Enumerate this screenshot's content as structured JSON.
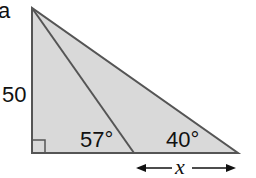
{
  "figure": {
    "corner_label": "a",
    "side_label": "50",
    "angle_inner": "57°",
    "angle_outer": "40°",
    "segment_label": "x",
    "colors": {
      "fill": "#d9d9d9",
      "stroke": "#555555",
      "background": "#ffffff"
    }
  }
}
